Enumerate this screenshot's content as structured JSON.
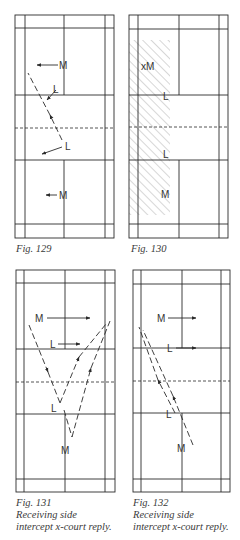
{
  "figures": [
    {
      "id": "fig129",
      "caption": [
        "Fig. 129"
      ],
      "court": {
        "x1": 15,
        "x2": 114,
        "xi1": 25,
        "xi2": 105,
        "xc": 64,
        "y1": 15,
        "yb1": 28,
        "ys1": 95,
        "yn": 128,
        "ys2": 160,
        "yb2": 224,
        "y2": 238
      },
      "labels": [
        {
          "text": "M",
          "x": 59,
          "y": 69
        },
        {
          "text": "L",
          "x": 53,
          "y": 93
        },
        {
          "text": "L",
          "x": 65,
          "y": 150
        },
        {
          "text": "M",
          "x": 59,
          "y": 199
        }
      ],
      "arrows": [
        {
          "x1": 58,
          "y1": 65,
          "x2": 37,
          "y2": 65,
          "dashed": false
        },
        {
          "x1": 56,
          "y1": 90,
          "x2": 47,
          "y2": 100,
          "dashed": false
        },
        {
          "x1": 62,
          "y1": 147,
          "x2": 42,
          "y2": 154,
          "dashed": false
        },
        {
          "x1": 57,
          "y1": 195,
          "x2": 46,
          "y2": 195,
          "dashed": false
        },
        {
          "x1": 62,
          "y1": 140,
          "x2": 50,
          "y2": 115,
          "dashed": true,
          "head": true
        },
        {
          "x1": 50,
          "y1": 115,
          "x2": 28,
          "y2": 73,
          "dashed": true,
          "head": false
        }
      ]
    },
    {
      "id": "fig130",
      "caption": [
        "Fig. 130"
      ],
      "court": {
        "x1": 129,
        "x2": 228,
        "xi1": 138,
        "xi2": 219,
        "xc": 179,
        "y1": 15,
        "yb1": 29,
        "ys1": 95,
        "yn": 127,
        "ys2": 160,
        "yb2": 224,
        "y2": 238
      },
      "hatch": {
        "x": 129,
        "y": 40,
        "w": 41,
        "h": 175
      },
      "labels": [
        {
          "text": "xM",
          "x": 141,
          "y": 70
        },
        {
          "text": "L",
          "x": 163,
          "y": 100
        },
        {
          "text": "L",
          "x": 163,
          "y": 158
        },
        {
          "text": "M",
          "x": 161,
          "y": 198
        }
      ],
      "arrows": []
    },
    {
      "id": "fig131",
      "caption": [
        "Fig. 131",
        "Receiving side",
        "intercept x-court reply."
      ],
      "court": {
        "x1": 16,
        "x2": 115,
        "xi1": 24,
        "xi2": 105,
        "xc": 65,
        "y1": 270,
        "yb1": 283,
        "ys1": 349,
        "yn": 382,
        "ys2": 414,
        "yb2": 479,
        "y2": 492
      },
      "labels": [
        {
          "text": "M",
          "x": 35,
          "y": 322
        },
        {
          "text": "L",
          "x": 50,
          "y": 348
        },
        {
          "text": "L",
          "x": 51,
          "y": 412
        },
        {
          "text": "M",
          "x": 61,
          "y": 454
        }
      ],
      "arrows": [
        {
          "x1": 47,
          "y1": 318,
          "x2": 90,
          "y2": 318,
          "dashed": false
        },
        {
          "x1": 58,
          "y1": 344,
          "x2": 80,
          "y2": 344,
          "dashed": false
        },
        {
          "x1": 29,
          "y1": 325,
          "x2": 48,
          "y2": 372,
          "dashed": true,
          "head": true
        },
        {
          "x1": 48,
          "y1": 372,
          "x2": 60,
          "y2": 403,
          "dashed": true,
          "head": false
        },
        {
          "x1": 60,
          "y1": 403,
          "x2": 79,
          "y2": 357,
          "dashed": true,
          "head": true
        },
        {
          "x1": 79,
          "y1": 357,
          "x2": 106,
          "y2": 324,
          "dashed": true,
          "head": false
        },
        {
          "x1": 64,
          "y1": 410,
          "x2": 72,
          "y2": 437,
          "dashed": true,
          "head": false
        },
        {
          "x1": 72,
          "y1": 437,
          "x2": 91,
          "y2": 368,
          "dashed": true,
          "head": true
        },
        {
          "x1": 91,
          "y1": 368,
          "x2": 110,
          "y2": 321,
          "dashed": true,
          "head": false
        }
      ]
    },
    {
      "id": "fig132",
      "caption": [
        "Fig. 132",
        "Receiving side",
        "intercept x-court reply."
      ],
      "court": {
        "x1": 133,
        "x2": 230,
        "xi1": 141,
        "xi2": 221,
        "xc": 182,
        "y1": 270,
        "yb1": 284,
        "ys1": 348,
        "yn": 381,
        "ys2": 413,
        "yb2": 479,
        "y2": 492
      },
      "labels": [
        {
          "text": "M",
          "x": 157,
          "y": 322
        },
        {
          "text": "L",
          "x": 167,
          "y": 352
        },
        {
          "text": "L",
          "x": 166,
          "y": 418
        },
        {
          "text": "M",
          "x": 177,
          "y": 452
        }
      ],
      "arrows": [
        {
          "x1": 168,
          "y1": 318,
          "x2": 196,
          "y2": 318,
          "dashed": false
        },
        {
          "x1": 176,
          "y1": 348,
          "x2": 196,
          "y2": 348,
          "dashed": false
        },
        {
          "x1": 175,
          "y1": 413,
          "x2": 158,
          "y2": 380,
          "dashed": true,
          "head": true
        },
        {
          "x1": 158,
          "y1": 380,
          "x2": 139,
          "y2": 327,
          "dashed": true,
          "head": false
        },
        {
          "x1": 193,
          "y1": 445,
          "x2": 173,
          "y2": 396,
          "dashed": true,
          "head": true
        },
        {
          "x1": 173,
          "y1": 396,
          "x2": 143,
          "y2": 330,
          "dashed": true,
          "head": false
        }
      ]
    }
  ],
  "colors": {
    "line": "#2a2a2a",
    "hatch": "#9a9a9a",
    "caption": "#3a3a3a"
  }
}
